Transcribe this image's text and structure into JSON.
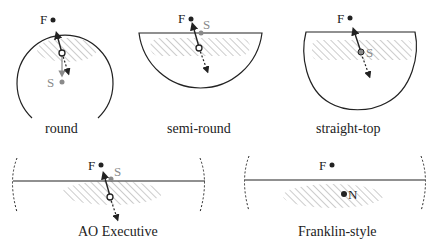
{
  "colors": {
    "line": "#222222",
    "hatch": "#9a9a9a",
    "gray_marker": "#8a8a8a",
    "background": "#ffffff"
  },
  "panels": [
    {
      "id": "round",
      "caption": "round",
      "markers": {
        "F": "F",
        "S": "S"
      }
    },
    {
      "id": "semi-round",
      "caption": "semi-round",
      "markers": {
        "F": "F",
        "S": "S"
      }
    },
    {
      "id": "straight-top",
      "caption": "straight-top",
      "markers": {
        "F": "F",
        "S": "S"
      }
    },
    {
      "id": "ao-executive",
      "caption": "AO Executive",
      "markers": {
        "F": "F",
        "S": "S"
      }
    },
    {
      "id": "franklin-style",
      "caption": "Franklin-style",
      "markers": {
        "F": "F",
        "N": "N"
      }
    }
  ]
}
